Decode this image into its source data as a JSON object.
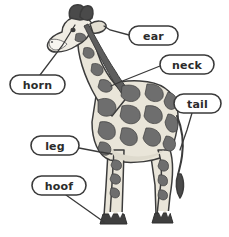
{
  "figure": {
    "background_color": "#ffffff"
  },
  "palette": {
    "outline": "#3c3c3c",
    "patch": "#6e6e6e",
    "patch_dark": "#5d5d5d",
    "coat_light": "#e9e5d9",
    "belly": "#dedacd",
    "muzzle": "#f0ede4",
    "horn_dark": "#4a4a4a",
    "hoof_dark": "#3f3f3f",
    "label_text": "#2b2b2b",
    "label_fill": "#ffffff",
    "label_stroke": "#3a3a3a",
    "leader_line": "#3a3a3a"
  },
  "labels": [
    {
      "id": "ear",
      "text": "ear",
      "pill": {
        "x": 129,
        "y": 26,
        "width": 49,
        "height": 19,
        "rx": 9.5
      },
      "text_x": 153.5,
      "text_y": 36,
      "leader": "M 129 35 L 110 30 L 104 26",
      "target": "ear of the giraffe"
    },
    {
      "id": "neck",
      "text": "neck",
      "pill": {
        "x": 160,
        "y": 55,
        "width": 54,
        "height": 19,
        "rx": 9.5
      },
      "text_x": 187,
      "text_y": 65,
      "leader": "M 160 66 L 120 82 L 111 86",
      "target": "neck of the giraffe"
    },
    {
      "id": "tail",
      "text": "tail",
      "pill": {
        "x": 174,
        "y": 94,
        "width": 47,
        "height": 19,
        "rx": 9.5
      },
      "text_x": 197.5,
      "text_y": 104,
      "leader": "M 192 113 L 187 130 L 180 150",
      "target": "tail of the giraffe"
    },
    {
      "id": "horn",
      "text": "horn",
      "pill": {
        "x": 10,
        "y": 75,
        "width": 55,
        "height": 19,
        "rx": 9.5
      },
      "text_x": 37.5,
      "text_y": 85,
      "leader": "M 40 75 L 62 46 L 75 25",
      "target": "horn (ossicone) of the giraffe"
    },
    {
      "id": "leg",
      "text": "leg",
      "pill": {
        "x": 31,
        "y": 136,
        "width": 48,
        "height": 19,
        "rx": 9.5
      },
      "text_x": 55,
      "text_y": 146,
      "leader": "M 79 148 L 100 152 L 112 154",
      "target": "leg of the giraffe"
    },
    {
      "id": "hoof",
      "text": "hoof",
      "pill": {
        "x": 32,
        "y": 176,
        "width": 54,
        "height": 19,
        "rx": 9.5
      },
      "text_x": 59,
      "text_y": 186,
      "leader": "M 66 195 L 90 212 L 104 222",
      "target": "hoof of the giraffe"
    }
  ],
  "body_parts": [
    "horn",
    "ear",
    "neck",
    "tail",
    "leg",
    "hoof"
  ]
}
